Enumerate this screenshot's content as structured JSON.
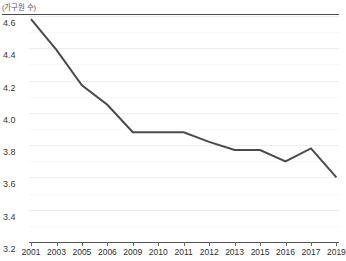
{
  "chart_data": {
    "type": "line",
    "title": "",
    "subtitle": "",
    "xlabel": "",
    "ylabel": "(가구원 수)",
    "ylim": [
      3.2,
      4.6
    ],
    "ytick_labels": [
      "4.6",
      "4.4",
      "4.2",
      "4.0",
      "3.8",
      "3.6",
      "3.4",
      "3.2"
    ],
    "ytick_values": [
      4.6,
      4.4,
      4.2,
      4.0,
      3.8,
      3.6,
      3.4,
      3.2
    ],
    "minor_gridlines": true,
    "grid": true,
    "legend": "none",
    "categories": [
      "2001",
      "2003",
      "2005",
      "2006",
      "2009",
      "2010",
      "2011",
      "2012",
      "2013",
      "2015",
      "2016",
      "2017",
      "2019"
    ],
    "values": [
      4.58,
      4.39,
      4.17,
      4.05,
      3.88,
      3.88,
      3.88,
      3.82,
      3.77,
      3.77,
      3.7,
      3.78,
      3.6
    ],
    "series": [
      {
        "name": "가구원 수",
        "color": "#4a4a4a",
        "values": [
          4.58,
          4.39,
          4.17,
          4.05,
          3.88,
          3.88,
          3.88,
          3.82,
          3.77,
          3.77,
          3.7,
          3.78,
          3.6
        ]
      }
    ],
    "line_color": "#4a4a4a",
    "line_width": 2,
    "markers": false,
    "background": "#ffffff",
    "gridline_color": "#ededed"
  }
}
